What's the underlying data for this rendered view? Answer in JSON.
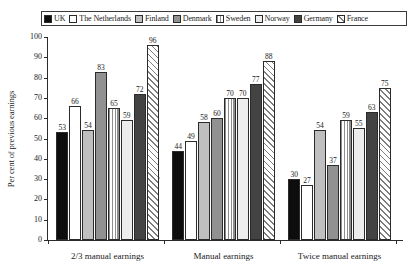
{
  "chart_data": {
    "type": "bar",
    "title": "",
    "xlabel": "",
    "ylabel": "Per cent of previous earnings",
    "ylim": [
      0,
      100
    ],
    "yticks": [
      0,
      10,
      20,
      30,
      40,
      50,
      60,
      70,
      80,
      90,
      100
    ],
    "grid": false,
    "legend_position": "top",
    "categories": [
      "2/3 manual earnings",
      "Manual earnings",
      "Twice manual earnings"
    ],
    "series": [
      {
        "name": "UK",
        "pattern": "solid-black",
        "values": [
          53,
          44,
          30
        ]
      },
      {
        "name": "The Netherlands",
        "pattern": "white",
        "values": [
          66,
          49,
          27
        ]
      },
      {
        "name": "Finland",
        "pattern": "light-gray",
        "values": [
          54,
          58,
          54
        ]
      },
      {
        "name": "Denmark",
        "pattern": "medium-gray",
        "values": [
          83,
          60,
          37
        ]
      },
      {
        "name": "Sweden",
        "pattern": "vertical-stripe",
        "values": [
          65,
          70,
          59
        ]
      },
      {
        "name": "Norway",
        "pattern": "very-light",
        "values": [
          59,
          70,
          55
        ]
      },
      {
        "name": "Germany",
        "pattern": "dark-gray",
        "values": [
          72,
          77,
          63
        ]
      },
      {
        "name": "France",
        "pattern": "diagonal-hatch",
        "values": [
          96,
          88,
          75
        ]
      }
    ]
  },
  "legend": {
    "items": [
      {
        "label": "UK"
      },
      {
        "label": "The Netherlands"
      },
      {
        "label": "Finland"
      },
      {
        "label": "Denmark"
      },
      {
        "label": "Sweden"
      },
      {
        "label": "Norway"
      },
      {
        "label": "Germany"
      },
      {
        "label": "France"
      }
    ]
  },
  "axes": {
    "y_title": "Per cent of previous earnings",
    "y_tick_labels": [
      "100",
      "90",
      "80",
      "70",
      "60",
      "50",
      "40",
      "30",
      "20",
      "10",
      "0"
    ],
    "x_tick_labels": [
      "2/3 manual earnings",
      "Manual earnings",
      "Twice manual earnings"
    ]
  },
  "colors": {
    "axis": "#2b2b2b",
    "text": "#1a1a1a",
    "background": "#ffffff",
    "solid_black": "#0d0d0d",
    "light_gray": "#bfbfbf",
    "medium_gray": "#919191",
    "very_light": "#ededed",
    "dark_gray": "#434343"
  }
}
